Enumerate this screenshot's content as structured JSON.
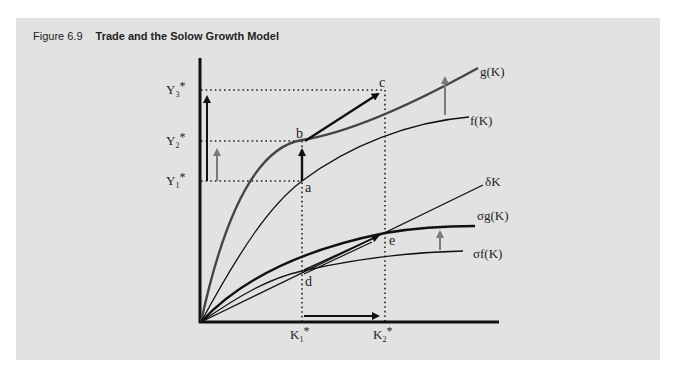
{
  "figure": {
    "number": "Figure 6.9",
    "title": "Trade and the Solow Growth Model"
  },
  "axes": {
    "y_ticks": [
      {
        "label": "Y",
        "sub": "3",
        "sup": "*"
      },
      {
        "label": "Y",
        "sub": "2",
        "sup": "*"
      },
      {
        "label": "Y",
        "sub": "1",
        "sup": "*"
      }
    ],
    "x_ticks": [
      {
        "label": "K",
        "sub": "1",
        "sup": "*"
      },
      {
        "label": "K",
        "sub": "2",
        "sup": "*"
      }
    ]
  },
  "curves": {
    "g": "g(K)",
    "f": "f(K)",
    "delta": "δK",
    "sigma_g": "σg(K)",
    "sigma_f": "σf(K)"
  },
  "points": {
    "a": "a",
    "b": "b",
    "c": "c",
    "d": "d",
    "e": "e"
  },
  "colors": {
    "panel_bg": "#e2e2e2",
    "line": "#111111",
    "g_curve": "#444444",
    "shift_arrow": "#7a7a7a"
  }
}
